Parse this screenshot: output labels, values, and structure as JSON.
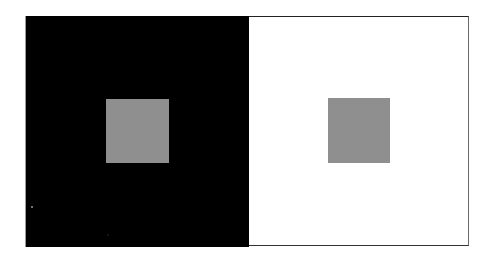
{
  "figure": {
    "type": "simultaneous-contrast-illusion",
    "left_panel": {
      "background_color": "#000000"
    },
    "right_panel": {
      "background_color": "#ffffff",
      "border_color": "#222222"
    },
    "squares": [
      {
        "position": "left",
        "color": "#8f8f8f"
      },
      {
        "position": "right",
        "color": "#8f8f8f"
      }
    ],
    "specks": [
      {
        "x": 31,
        "y": 206,
        "color": "#9a9a9a"
      },
      {
        "x": 107,
        "y": 234,
        "color": "#1a1a1a"
      }
    ]
  }
}
